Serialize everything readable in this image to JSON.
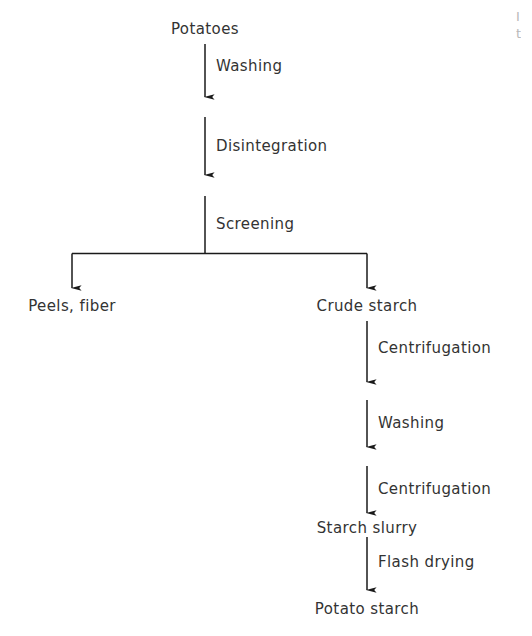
{
  "diagram": {
    "background_color": "#ffffff",
    "stroke_color": "#1a1a1a",
    "text_color": "#333333",
    "nodes": [
      {
        "id": "potatoes",
        "label": "Potatoes"
      },
      {
        "id": "peels_fiber",
        "label": "Peels, fiber"
      },
      {
        "id": "crude_starch",
        "label": "Crude starch"
      },
      {
        "id": "starch_slurry",
        "label": "Starch slurry"
      },
      {
        "id": "potato_starch",
        "label": "Potato starch"
      }
    ],
    "edges": [
      {
        "id": "washing_1",
        "label": "Washing"
      },
      {
        "id": "disintegration",
        "label": "Disintegration"
      },
      {
        "id": "screening",
        "label": "Screening"
      },
      {
        "id": "centrifugation_1",
        "label": "Centrifugation"
      },
      {
        "id": "washing_2",
        "label": "Washing"
      },
      {
        "id": "centrifugation_2",
        "label": "Centrifugation"
      },
      {
        "id": "flash_drying",
        "label": "Flash drying"
      }
    ],
    "clipped_caption": {
      "line1": "I",
      "line2": "t"
    }
  }
}
